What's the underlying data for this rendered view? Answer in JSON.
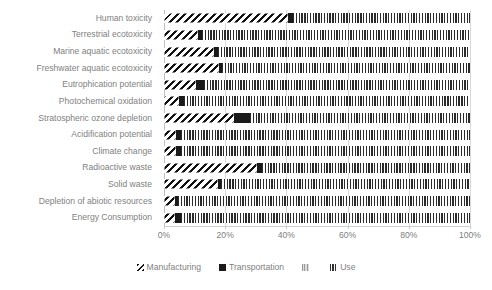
{
  "chart_data": {
    "type": "bar",
    "orientation": "horizontal",
    "stacked": true,
    "normalized_percent": true,
    "title": "",
    "xlabel": "",
    "ylabel": "",
    "xlim": [
      0,
      100
    ],
    "grid": true,
    "legend_position": "bottom",
    "xticks": [
      "0%",
      "20%",
      "40%",
      "60%",
      "80%",
      "100%"
    ],
    "xtick_values": [
      0,
      20,
      40,
      60,
      80,
      100
    ],
    "categories": [
      "Human toxicity",
      "Terrestrial ecotoxicity",
      "Marine aquatic ecotoxicity",
      "Freshwater aquatic ecotoxicity",
      "Eutrophication potential",
      "Photochemical oxidation",
      "Stratospheric ozone depletion",
      "Acidification potential",
      "Climate change",
      "Radioactive waste",
      "Solid waste",
      "Depletion of abiotic resources",
      "Energy Consumption"
    ],
    "series": [
      {
        "name": "Manufacturing",
        "pattern": "diagonal-hatch",
        "color": "#111111",
        "values": [
          40.5,
          11.0,
          16.5,
          18.0,
          10.5,
          5.0,
          23.0,
          4.0,
          4.0,
          30.5,
          17.5,
          3.5,
          3.5
        ]
      },
      {
        "name": "Transportation",
        "pattern": "solid-black",
        "color": "#1a1a1a",
        "values": [
          1.5,
          1.5,
          1.0,
          1.0,
          2.5,
          1.5,
          5.0,
          1.5,
          1.5,
          1.5,
          1.0,
          1.0,
          2.0
        ]
      },
      {
        "name": "",
        "pattern": "light-grey",
        "color": "#e0e0e0",
        "values": [
          0.0,
          0.0,
          0.0,
          0.0,
          0.0,
          0.0,
          0.0,
          0.0,
          0.0,
          0.0,
          0.0,
          0.0,
          0.0
        ]
      },
      {
        "name": "Use",
        "pattern": "vertical-stripe",
        "color": "#2b2b2b",
        "values": [
          58.0,
          87.5,
          82.5,
          81.0,
          87.0,
          93.5,
          72.0,
          94.5,
          94.5,
          68.0,
          81.5,
          95.5,
          94.5
        ]
      }
    ]
  },
  "legend": {
    "items": [
      {
        "label": "Manufacturing",
        "key": "manufacturing"
      },
      {
        "label": "Transportation",
        "key": "transportation"
      },
      {
        "label": "",
        "key": "series3"
      },
      {
        "label": "Use",
        "key": "use"
      }
    ]
  },
  "colors": {
    "manufacturing": "#111111",
    "transportation": "#1a1a1a",
    "series3": "#e0e0e0",
    "use": "#2b2b2b",
    "gridline": "#d9d9d9",
    "text": "#7f7f7f",
    "background": "#ffffff"
  }
}
